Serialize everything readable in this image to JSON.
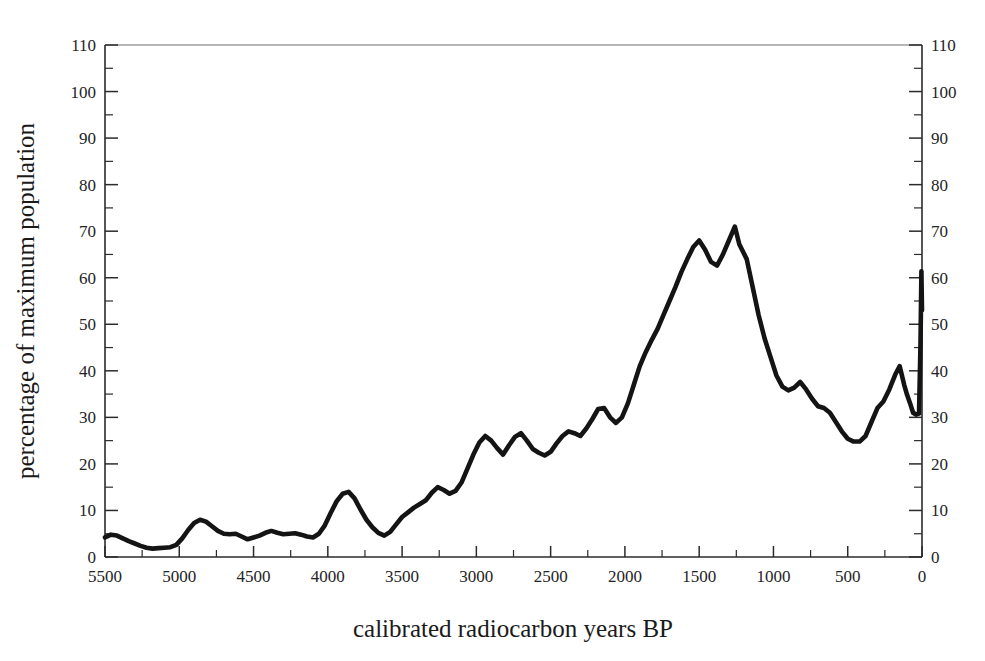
{
  "chart_data": {
    "type": "line",
    "title": "",
    "subtitle": "",
    "xlabel": "calibrated radiocarbon years BP",
    "ylabel": "percentage of maximum population",
    "ylabel_right": "",
    "xlim": [
      5500,
      0
    ],
    "ylim": [
      0,
      110
    ],
    "x_reversed": true,
    "grid": false,
    "legend": null,
    "line_color": "#141414",
    "axis_color": "#2b2b2b",
    "background": "#ffffff",
    "x_ticks_major": [
      5500,
      5000,
      4500,
      4000,
      3500,
      3000,
      2500,
      2000,
      1500,
      1000,
      500,
      0
    ],
    "x_tick_labels": [
      "5500",
      "5000",
      "4500",
      "4000",
      "3500",
      "3000",
      "2500",
      "2000",
      "1500",
      "1000",
      "500",
      "0"
    ],
    "x_minor_interval": 250,
    "y_ticks_major": [
      0,
      10,
      20,
      30,
      40,
      50,
      60,
      70,
      80,
      90,
      100,
      110
    ],
    "y_tick_labels": [
      "0",
      "10",
      "20",
      "30",
      "40",
      "50",
      "60",
      "70",
      "80",
      "90",
      "100",
      "110"
    ],
    "y_tick_labels_right": [
      "0",
      "10",
      "20",
      "30",
      "40",
      "50",
      "60",
      "70",
      "80",
      "90",
      "100",
      "110"
    ],
    "y_minor_interval": 5,
    "series": [
      {
        "name": "summed probability population proxy",
        "x": [
          5500,
          5460,
          5420,
          5380,
          5340,
          5300,
          5260,
          5220,
          5180,
          5140,
          5100,
          5060,
          5020,
          4980,
          4940,
          4900,
          4860,
          4820,
          4780,
          4740,
          4700,
          4660,
          4620,
          4580,
          4540,
          4500,
          4460,
          4420,
          4380,
          4340,
          4300,
          4260,
          4220,
          4180,
          4140,
          4100,
          4060,
          4020,
          3980,
          3940,
          3900,
          3860,
          3820,
          3780,
          3740,
          3700,
          3660,
          3620,
          3580,
          3540,
          3500,
          3460,
          3420,
          3380,
          3340,
          3300,
          3260,
          3220,
          3180,
          3140,
          3100,
          3060,
          3020,
          2980,
          2940,
          2900,
          2860,
          2820,
          2780,
          2740,
          2700,
          2660,
          2620,
          2580,
          2540,
          2500,
          2460,
          2420,
          2380,
          2340,
          2300,
          2260,
          2220,
          2180,
          2140,
          2100,
          2060,
          2020,
          1980,
          1940,
          1900,
          1860,
          1820,
          1780,
          1740,
          1700,
          1660,
          1620,
          1580,
          1540,
          1500,
          1460,
          1420,
          1380,
          1340,
          1300,
          1260,
          1220,
          1180,
          1140,
          1100,
          1060,
          1020,
          980,
          940,
          900,
          860,
          820,
          780,
          740,
          700,
          660,
          620,
          580,
          540,
          500,
          460,
          420,
          380,
          340,
          300,
          260,
          220,
          180,
          140,
          100,
          70,
          50,
          30,
          10,
          0
        ],
        "y": [
          4.2,
          4.8,
          4.6,
          4.0,
          3.4,
          2.9,
          2.4,
          2.0,
          1.8,
          1.9,
          2.0,
          2.1,
          2.6,
          4.0,
          5.8,
          7.3,
          8.0,
          7.6,
          6.6,
          5.6,
          5.0,
          4.9,
          5.0,
          4.4,
          3.8,
          4.2,
          4.6,
          5.2,
          5.6,
          5.2,
          4.9,
          5.0,
          5.1,
          4.8,
          4.4,
          4.2,
          5.0,
          6.8,
          9.5,
          12.0,
          13.6,
          14.0,
          12.6,
          10.2,
          8.0,
          6.4,
          5.2,
          4.6,
          5.4,
          7.0,
          8.6,
          9.6,
          10.6,
          11.4,
          12.2,
          13.8,
          15.0,
          14.4,
          13.6,
          14.2,
          16.0,
          19.0,
          22.0,
          24.6,
          26.0,
          25.0,
          23.4,
          22.0,
          24.0,
          25.8,
          26.6,
          25.0,
          23.2,
          22.4,
          21.8,
          22.6,
          24.4,
          26.0,
          27.0,
          26.6,
          26.0,
          27.6,
          29.6,
          31.8,
          32.0,
          30.0,
          28.8,
          30.0,
          33.0,
          37.0,
          41.0,
          44.0,
          46.6,
          49.0,
          52.0,
          55.0,
          58.0,
          61.2,
          64.0,
          66.6,
          68.0,
          66.0,
          63.4,
          62.6,
          65.0,
          68.0,
          71.0,
          73.4,
          75.4,
          76.0,
          74.6,
          72.0,
          70.0,
          69.0,
          71.0,
          74.0,
          77.0,
          80.0,
          83.0,
          85.6,
          87.4,
          88.0,
          86.0,
          83.0,
          80.6,
          79.0,
          80.0,
          83.0,
          87.0,
          92.0,
          97.0,
          100.8,
          96.0,
          90.0,
          83.0,
          76.0,
          70.0,
          64.0,
          63.4,
          66.0,
          67.2
        ]
      }
    ],
    "data_notes": {
      "peak_value": 100.8,
      "peak_x": 1540,
      "final_value": 53.0,
      "minimum_value": 1.8,
      "minimum_x": 5180
    },
    "segments_after_peak": {
      "x": [
        1230,
        1180,
        1140,
        1100,
        1060,
        1020,
        980,
        940,
        900,
        860,
        820,
        780,
        740,
        700,
        660,
        620,
        580,
        540,
        500,
        460,
        420,
        380,
        340,
        300,
        260,
        220,
        180,
        150,
        120,
        100,
        80,
        60,
        40,
        20
      ],
      "y": [
        67.2,
        64.0,
        58.0,
        52.0,
        47.0,
        43.0,
        39.0,
        36.6,
        35.8,
        36.4,
        37.6,
        36.0,
        34.0,
        32.4,
        32.0,
        31.0,
        29.0,
        27.0,
        25.4,
        24.8,
        24.8,
        26.0,
        29.0,
        32.0,
        33.4,
        36.0,
        39.2,
        41.0,
        37.0,
        34.8,
        33.0,
        31.0,
        30.6,
        30.8
      ]
    },
    "final_spike": {
      "x": [
        20,
        10,
        4,
        0
      ],
      "y": [
        30.8,
        46.0,
        61.4,
        53.0
      ]
    }
  },
  "figure": {
    "axis_title_x": "calibrated radiocarbon years BP",
    "axis_title_y": "percentage of maximum population"
  }
}
